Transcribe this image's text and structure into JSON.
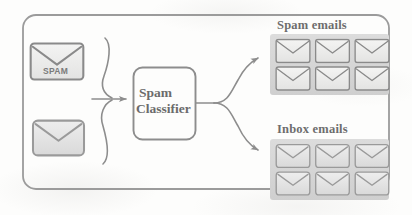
{
  "figure": {
    "kind": "flow-diagram",
    "background_color": "#fdfdfc",
    "stroke_color": "#8d8d8d",
    "text_color": "#6b6b6b",
    "panel_fill": "#d6d6d6"
  },
  "input": {
    "envelopes": [
      {
        "id": "spam-input",
        "label": "SPAM",
        "has_label": true
      },
      {
        "id": "plain-input",
        "label": "",
        "has_label": false
      }
    ]
  },
  "classifier": {
    "line1": "Spam",
    "line2": "Classifier"
  },
  "outputs": [
    {
      "id": "spam-emails",
      "title": "Spam emails",
      "envelope_count": 6,
      "rows": 2,
      "cols": 3,
      "envelope_style": "outline"
    },
    {
      "id": "inbox-emails",
      "title": "Inbox emails",
      "envelope_count": 6,
      "rows": 2,
      "cols": 3,
      "envelope_style": "filled"
    }
  ],
  "arrows": {
    "input_merge": "two curved feeds merge into one arrow",
    "output_split": "one feed splits into two curved arrows"
  }
}
